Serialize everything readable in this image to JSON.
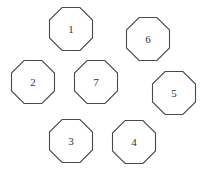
{
  "diagram": {
    "type": "node-layout",
    "shape": "octagon",
    "stroke_color": "#4a4a4a",
    "background": "#ffffff",
    "nodes": [
      {
        "label": "1",
        "cx": 71,
        "cy": 29
      },
      {
        "label": "6",
        "cx": 148,
        "cy": 39
      },
      {
        "label": "2",
        "cx": 33,
        "cy": 82
      },
      {
        "label": "7",
        "cx": 96,
        "cy": 82
      },
      {
        "label": "5",
        "cx": 174,
        "cy": 93
      },
      {
        "label": "3",
        "cx": 71,
        "cy": 141
      },
      {
        "label": "4",
        "cx": 134,
        "cy": 142
      }
    ]
  }
}
